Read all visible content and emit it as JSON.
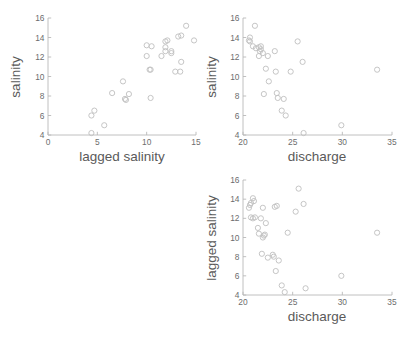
{
  "figure": {
    "type": "scatter-matrix",
    "background": "#ffffff",
    "marker_color": "#c2c2c2",
    "axis_color": "#b9b9b9",
    "label_color": "#5a5a5a",
    "tick_color": "#6d6d6d"
  },
  "chart_data": [
    {
      "id": "salinity-vs-lagged-salinity",
      "type": "scatter",
      "title": "",
      "xlabel": "lagged salinity",
      "ylabel": "salinity",
      "xlim": [
        0,
        15
      ],
      "ylim": [
        4,
        16
      ],
      "xticks": [
        0,
        5,
        10,
        15
      ],
      "yticks": [
        4,
        6,
        8,
        10,
        12,
        14,
        16
      ],
      "grid": false,
      "legend": "none",
      "marker": "open-circle",
      "points": [
        [
          4.4,
          4.2
        ],
        [
          4.4,
          6.0
        ],
        [
          4.7,
          6.5
        ],
        [
          5.7,
          5.0
        ],
        [
          6.5,
          8.3
        ],
        [
          7.6,
          9.5
        ],
        [
          7.8,
          7.7
        ],
        [
          7.9,
          7.6
        ],
        [
          8.2,
          8.2
        ],
        [
          10.4,
          7.8
        ],
        [
          10.3,
          10.7
        ],
        [
          10.4,
          10.7
        ],
        [
          10.0,
          12.1
        ],
        [
          10.0,
          13.2
        ],
        [
          10.5,
          13.1
        ],
        [
          11.5,
          12.1
        ],
        [
          11.9,
          12.6
        ],
        [
          11.9,
          13.0
        ],
        [
          11.9,
          13.6
        ],
        [
          12.1,
          13.7
        ],
        [
          12.5,
          12.4
        ],
        [
          12.5,
          12.6
        ],
        [
          12.9,
          10.5
        ],
        [
          13.4,
          10.5
        ],
        [
          13.2,
          14.1
        ],
        [
          13.5,
          14.2
        ],
        [
          13.5,
          11.5
        ],
        [
          14.0,
          15.2
        ],
        [
          14.8,
          13.7
        ]
      ]
    },
    {
      "id": "salinity-vs-discharge",
      "type": "scatter",
      "title": "",
      "xlabel": "discharge",
      "ylabel": "salinity",
      "xlim": [
        20,
        35
      ],
      "ylim": [
        4,
        16
      ],
      "xticks": [
        20,
        25,
        30,
        35
      ],
      "yticks": [
        4,
        6,
        8,
        10,
        12,
        14,
        16
      ],
      "grid": false,
      "legend": "none",
      "marker": "open-circle",
      "points": [
        [
          20.6,
          13.7
        ],
        [
          20.7,
          13.6
        ],
        [
          20.7,
          14.0
        ],
        [
          21.0,
          13.1
        ],
        [
          21.2,
          15.2
        ],
        [
          21.3,
          12.9
        ],
        [
          21.6,
          13.0
        ],
        [
          21.7,
          12.6
        ],
        [
          21.8,
          12.8
        ],
        [
          21.8,
          13.1
        ],
        [
          21.6,
          12.1
        ],
        [
          22.0,
          12.4
        ],
        [
          22.3,
          10.8
        ],
        [
          22.5,
          12.1
        ],
        [
          22.6,
          9.5
        ],
        [
          22.1,
          8.2
        ],
        [
          23.2,
          12.6
        ],
        [
          23.3,
          10.5
        ],
        [
          23.4,
          8.3
        ],
        [
          23.5,
          7.8
        ],
        [
          23.9,
          6.5
        ],
        [
          24.1,
          7.7
        ],
        [
          24.3,
          6.0
        ],
        [
          24.8,
          10.5
        ],
        [
          25.5,
          13.6
        ],
        [
          26.0,
          11.5
        ],
        [
          26.1,
          4.2
        ],
        [
          29.9,
          5.0
        ],
        [
          33.5,
          10.7
        ]
      ]
    },
    {
      "id": "lagged-salinity-vs-discharge",
      "type": "scatter",
      "title": "",
      "xlabel": "discharge",
      "ylabel": "lagged salinity",
      "xlim": [
        20,
        35
      ],
      "ylim": [
        4,
        16
      ],
      "xticks": [
        20,
        25,
        30,
        35
      ],
      "yticks": [
        4,
        6,
        8,
        10,
        12,
        14,
        16
      ],
      "grid": false,
      "legend": "none",
      "marker": "open-circle",
      "points": [
        [
          20.6,
          13.1
        ],
        [
          20.7,
          13.4
        ],
        [
          20.8,
          13.6
        ],
        [
          21.0,
          14.1
        ],
        [
          21.1,
          13.8
        ],
        [
          20.8,
          12.1
        ],
        [
          21.0,
          12.0
        ],
        [
          21.2,
          12.1
        ],
        [
          21.6,
          10.4
        ],
        [
          21.5,
          11.0
        ],
        [
          21.8,
          12.0
        ],
        [
          22.0,
          10.0
        ],
        [
          22.1,
          10.2
        ],
        [
          22.2,
          10.3
        ],
        [
          22.0,
          13.1
        ],
        [
          22.3,
          11.5
        ],
        [
          21.9,
          8.3
        ],
        [
          22.5,
          7.9
        ],
        [
          23.0,
          8.2
        ],
        [
          23.1,
          8.0
        ],
        [
          23.2,
          13.2
        ],
        [
          23.4,
          13.3
        ],
        [
          23.3,
          6.5
        ],
        [
          23.6,
          7.6
        ],
        [
          23.9,
          5.0
        ],
        [
          24.2,
          4.3
        ],
        [
          24.5,
          10.5
        ],
        [
          25.3,
          12.7
        ],
        [
          25.6,
          15.1
        ],
        [
          26.1,
          13.5
        ],
        [
          26.3,
          4.7
        ],
        [
          29.9,
          6.0
        ],
        [
          33.5,
          10.5
        ]
      ]
    }
  ]
}
